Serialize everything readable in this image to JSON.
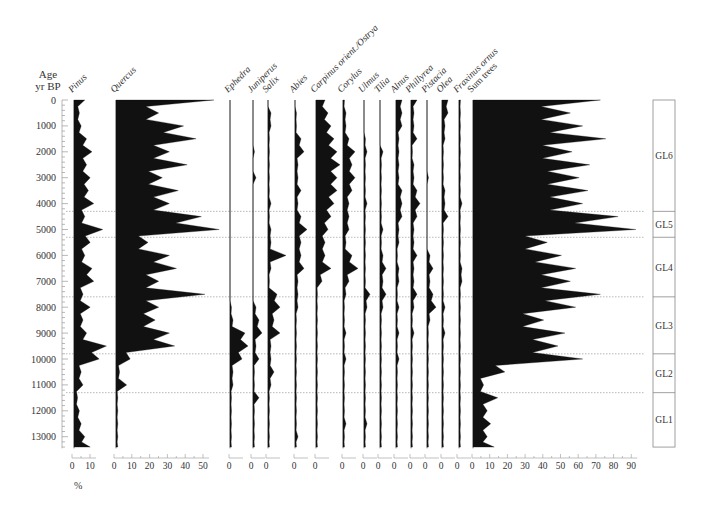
{
  "chart_data": {
    "type": "area",
    "title": "",
    "ylabel": "Age yr BP",
    "ylabel_lines": [
      "Age",
      "yr BP"
    ],
    "xlabel": "%",
    "y_ticks": [
      0,
      1000,
      2000,
      3000,
      4000,
      5000,
      6000,
      7000,
      8000,
      9000,
      10000,
      11000,
      12000,
      13000
    ],
    "ylim": [
      0,
      13500
    ],
    "plot": {
      "y_top_px": 100,
      "px_per_1000yr": 25.9,
      "y_bottom_px": 449
    },
    "ages": [
      0,
      500,
      1000,
      1500,
      2000,
      2500,
      3000,
      3500,
      4000,
      4500,
      5000,
      5500,
      6000,
      6500,
      7000,
      7500,
      8000,
      8500,
      9000,
      9500,
      10000,
      10500,
      11000,
      11500,
      12000,
      12500,
      13000,
      13400
    ],
    "series": [
      {
        "name": "Pinus",
        "italic": true,
        "x0": 74,
        "scale": 1.8,
        "axis_ticks": [
          0,
          10
        ],
        "axis_x0": 72,
        "values": [
          6,
          3,
          4,
          7,
          10,
          7,
          9,
          8,
          11,
          6,
          16,
          9,
          6,
          10,
          11,
          5,
          9,
          5,
          7,
          18,
          14,
          4,
          5,
          2,
          3,
          4,
          6,
          9
        ]
      },
      {
        "name": "Quercus",
        "italic": true,
        "x0": 116,
        "scale": 1.78,
        "axis_ticks": [
          0,
          10,
          20,
          30,
          40,
          50
        ],
        "axis_x0": 114,
        "values": [
          55,
          24,
          38,
          45,
          30,
          40,
          26,
          35,
          30,
          48,
          58,
          18,
          30,
          34,
          24,
          50,
          24,
          22,
          30,
          33,
          8,
          2,
          6,
          1,
          1,
          1,
          1,
          1
        ]
      },
      {
        "name": "Ephedra",
        "italic": true,
        "x0": 230,
        "scale": 3,
        "axis_ticks": [
          0
        ],
        "axis_x0": 229,
        "values": [
          0,
          0,
          0,
          0,
          0,
          0,
          0,
          0,
          0,
          0,
          0,
          0,
          0,
          0,
          0,
          0,
          0.5,
          1,
          5,
          6,
          4,
          1,
          1,
          0.5,
          0.5,
          0.5,
          0.5,
          0.5
        ]
      },
      {
        "name": "Juniperus",
        "italic": true,
        "x0": 253,
        "scale": 3,
        "axis_ticks": [
          0
        ],
        "axis_x0": 251,
        "values": [
          0,
          0,
          0,
          0,
          0.5,
          0,
          1,
          0,
          0,
          0,
          0,
          0,
          0,
          0,
          0,
          0,
          1,
          2,
          3,
          1,
          2,
          0.5,
          0.5,
          2,
          0.5,
          0.5,
          0.5,
          0.5
        ]
      },
      {
        "name": "Salix",
        "italic": true,
        "x0": 268,
        "scale": 3,
        "axis_ticks": [
          0
        ],
        "axis_x0": 266,
        "values": [
          0,
          1,
          1,
          0.5,
          0.5,
          0.5,
          0.5,
          0.5,
          1,
          0.5,
          1,
          1,
          6,
          1,
          0.5,
          3,
          4,
          2,
          4,
          1,
          1,
          2,
          1,
          0.5,
          0.5,
          0.5,
          0.5,
          0.5
        ]
      },
      {
        "name": "Abies",
        "italic": true,
        "x0": 295,
        "scale": 3,
        "axis_ticks": [
          0
        ],
        "axis_x0": 294,
        "values": [
          0,
          0.5,
          0.5,
          2,
          3,
          1,
          1,
          2,
          1,
          2,
          4,
          2,
          2,
          3,
          1,
          1,
          1,
          0.5,
          0.5,
          0.5,
          0.5,
          0.5,
          0.5,
          0.5,
          0.5,
          0.5,
          1,
          0.5
        ]
      },
      {
        "name": "Carpinus orient./Ostrya",
        "italic": true,
        "x0": 316,
        "scale": 3,
        "axis_ticks": [
          0
        ],
        "axis_x0": 315,
        "values": [
          3,
          4,
          5,
          6,
          7,
          8,
          7,
          7,
          6,
          5,
          4,
          3,
          3,
          5,
          2,
          0.5,
          0.5,
          0.5,
          0.5,
          0.5,
          0.5,
          0.5,
          0.5,
          0.5,
          0.5,
          0.5,
          0.5,
          0.5
        ]
      },
      {
        "name": "Corylus",
        "italic": true,
        "x0": 343,
        "scale": 3,
        "axis_ticks": [
          0
        ],
        "axis_x0": 342,
        "values": [
          0.5,
          1,
          1,
          2,
          4,
          3,
          4,
          3,
          2,
          2,
          2,
          1,
          3,
          5,
          2,
          1,
          0.5,
          0.5,
          1,
          0.5,
          1,
          0.5,
          0.5,
          0.5,
          0.5,
          1,
          0.5,
          0.5
        ]
      },
      {
        "name": "Ulmus",
        "italic": true,
        "x0": 364,
        "scale": 3,
        "axis_ticks": [
          0
        ],
        "axis_x0": 363,
        "values": [
          0,
          0,
          0,
          0.5,
          1,
          0.5,
          0.5,
          0.5,
          1,
          0.5,
          0.5,
          0.5,
          0.5,
          0.5,
          0.5,
          2,
          1,
          0.5,
          0.5,
          0.5,
          0.5,
          0.5,
          0.5,
          0.5,
          0.5,
          1,
          0.5,
          0.5
        ]
      },
      {
        "name": "Tilia",
        "italic": true,
        "x0": 380,
        "scale": 3,
        "axis_ticks": [
          0
        ],
        "axis_x0": 378,
        "values": [
          0,
          0,
          0,
          0,
          1,
          0.5,
          0.5,
          0.5,
          0.5,
          0.5,
          1,
          0.5,
          1,
          2,
          1,
          2,
          1,
          0.5,
          0.5,
          0.5,
          0.5,
          0.5,
          0.5,
          0.5,
          0.5,
          0.5,
          0.5,
          0.5
        ]
      },
      {
        "name": "Alnus",
        "italic": true,
        "x0": 396,
        "scale": 3,
        "axis_ticks": [
          0
        ],
        "axis_x0": 394,
        "values": [
          2,
          2,
          2,
          1,
          1,
          1,
          1,
          2,
          2,
          2,
          1,
          1,
          0.5,
          1,
          1,
          0.5,
          1,
          0.5,
          1,
          0.5,
          1,
          0.5,
          0.5,
          0.5,
          0.5,
          0.5,
          0.5,
          0.5
        ]
      },
      {
        "name": "Phillyrea",
        "italic": true,
        "x0": 411,
        "scale": 3,
        "axis_ticks": [
          0
        ],
        "axis_x0": 410,
        "values": [
          2,
          1,
          1,
          2,
          0.5,
          1,
          1,
          2,
          3,
          2,
          1,
          1,
          2,
          1,
          1,
          2,
          1,
          0.5,
          1,
          0.5,
          0.5,
          0.5,
          0.5,
          0.5,
          0.5,
          0.5,
          0.5,
          0.5
        ]
      },
      {
        "name": "Pistacia",
        "italic": true,
        "x0": 427,
        "scale": 3,
        "axis_ticks": [
          0
        ],
        "axis_x0": 425,
        "values": [
          0,
          0,
          0,
          0,
          0,
          0,
          0.5,
          0,
          0,
          0,
          0,
          0,
          1,
          2,
          1,
          2,
          3,
          1,
          0.5,
          0.5,
          0.5,
          0.5,
          0.5,
          0.5,
          0.5,
          0.5,
          0.5,
          0.5
        ]
      },
      {
        "name": "Olea",
        "italic": true,
        "x0": 442,
        "scale": 3,
        "axis_ticks": [
          0
        ],
        "axis_x0": 441,
        "values": [
          2,
          2,
          1,
          1,
          0.5,
          0.5,
          0.5,
          1,
          1,
          2,
          0.5,
          0.5,
          0.5,
          0.5,
          0.5,
          0.5,
          1,
          0.5,
          1,
          0.5,
          0.5,
          0.5,
          0.5,
          0.5,
          0.5,
          0.5,
          0.5,
          0.5
        ]
      },
      {
        "name": "Fraxinus ornus",
        "italic": true,
        "x0": 459,
        "scale": 3,
        "axis_ticks": [
          0
        ],
        "axis_x0": 457,
        "values": [
          0.5,
          0.5,
          0.5,
          0.5,
          0.5,
          0.5,
          0.5,
          0.5,
          1,
          0.5,
          0.5,
          0.5,
          0.5,
          1,
          1,
          0.5,
          0.5,
          0.5,
          0.5,
          0.5,
          0.5,
          0.5,
          0.5,
          0.5,
          0.5,
          0.5,
          0.5,
          0.5
        ]
      },
      {
        "name": "Sum trees",
        "italic": false,
        "x0": 473,
        "scale": 1.77,
        "axis_ticks": [
          0,
          10,
          20,
          30,
          40,
          50,
          60,
          70,
          80,
          90
        ],
        "axis_x0": 472,
        "values": [
          72,
          55,
          62,
          75,
          56,
          66,
          60,
          65,
          62,
          82,
          92,
          42,
          50,
          58,
          55,
          72,
          58,
          40,
          52,
          48,
          62,
          18,
          6,
          14,
          8,
          10,
          8,
          12
        ]
      }
    ],
    "zones": [
      {
        "label": "GL6",
        "top_age": 0,
        "bottom_age": 4300
      },
      {
        "label": "GL5",
        "top_age": 4300,
        "bottom_age": 5300
      },
      {
        "label": "GL4",
        "top_age": 5300,
        "bottom_age": 7600
      },
      {
        "label": "GL3",
        "top_age": 7600,
        "bottom_age": 9800
      },
      {
        "label": "GL2",
        "top_age": 9800,
        "bottom_age": 11300
      },
      {
        "label": "GL1",
        "top_age": 11300,
        "bottom_age": 13400
      }
    ],
    "zone_boundaries_dotted": [
      4300,
      5300,
      7600,
      9800,
      11300
    ],
    "legend_position": "none",
    "grid": false
  },
  "labels": {
    "age": "Age",
    "yrbp": "yr BP",
    "percent": "%"
  }
}
